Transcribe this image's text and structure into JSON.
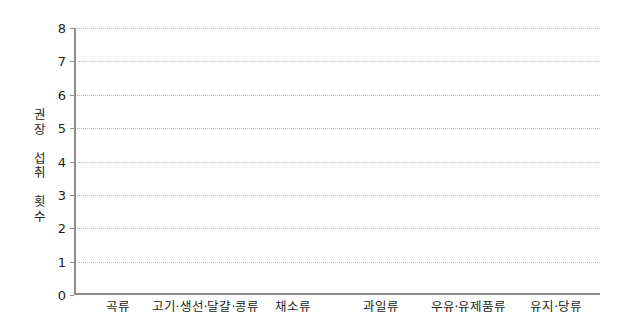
{
  "chart_data": {
    "type": "bar",
    "title": "",
    "subtitle": "",
    "xlabel": "",
    "ylabel": "권장 섭취 횟수",
    "categories": [
      "곡류",
      "고기·생선·달걀·콩류",
      "채소류",
      "과일류",
      "우유·유제품류",
      "유지·당류"
    ],
    "values": [
      null,
      null,
      null,
      null,
      null,
      null
    ],
    "series": [],
    "ylim": [
      0,
      8
    ],
    "y_ticks": [
      0,
      1,
      2,
      3,
      4,
      5,
      6,
      7,
      8
    ],
    "y_tick_labels": [
      "0",
      "1",
      "2",
      "3",
      "4",
      "5",
      "6",
      "7",
      "8"
    ],
    "grid": "horizontal-dotted",
    "legend": "none",
    "annotations": [],
    "note": "빈 그래프 (데이터 없음)"
  },
  "axes": {
    "y_title_lines": [
      "권장",
      "섭취",
      "횟수"
    ],
    "y_title_stacked": "권\n장\n\n섭\n취\n\n횟\n수"
  },
  "colors": {
    "axis": "#8d8d8d",
    "gridline": "#bdbdbd",
    "text": "#231f20",
    "background": "#ffffff"
  }
}
